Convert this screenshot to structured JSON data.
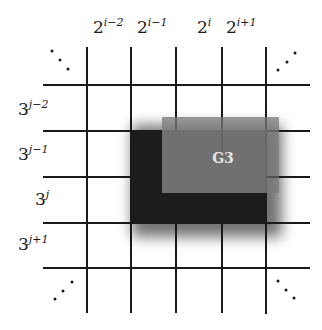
{
  "diagram": {
    "type": "grid-partition",
    "column_labels": [
      {
        "base": "2",
        "exp": "i−2"
      },
      {
        "base": "2",
        "exp": "i−1"
      },
      {
        "base": "2",
        "exp": "i"
      },
      {
        "base": "2",
        "exp": "i+1"
      }
    ],
    "row_labels": [
      {
        "base": "3",
        "exp": "j−2"
      },
      {
        "base": "3",
        "exp": "j−1"
      },
      {
        "base": "3",
        "exp": "j"
      },
      {
        "base": "3",
        "exp": "j+1"
      }
    ],
    "ellipses": {
      "top_left": "⋱",
      "top_right": "⋰",
      "bottom_left": "⋰",
      "bottom_right": "⋱"
    },
    "region_label": "G3",
    "colors": {
      "grid_line": "#1a1a1a",
      "dark_region": "#1c1c1c",
      "gray_region": "#7a7a7a",
      "region_label": "#e6e6e6",
      "background": "#ffffff"
    }
  }
}
